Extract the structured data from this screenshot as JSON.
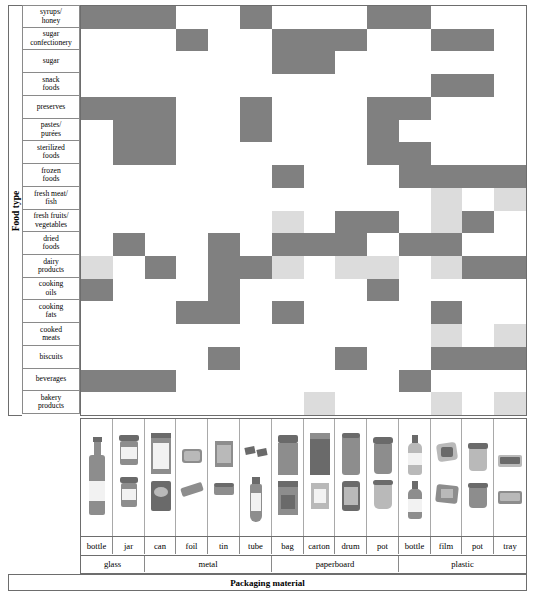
{
  "axis": {
    "y_title": "Food type",
    "x_title": "Packaging material"
  },
  "colors": {
    "filled": "#808080",
    "partial": "#dcdcdc",
    "empty": "#ffffff",
    "grid_border": "#6d6d6d"
  },
  "legend": {
    "filled_meaning": "suitable",
    "partial_meaning": "limited / conditional"
  },
  "rows": [
    {
      "label": "syrups/\nhoney",
      "line1": "syrups/",
      "line2": "honey"
    },
    {
      "label": "sugar\nconfectionery",
      "line1": "sugar",
      "line2": "confectionery"
    },
    {
      "label": "sugar",
      "line1": "sugar",
      "line2": ""
    },
    {
      "label": "snack\nfoods",
      "line1": "snack",
      "line2": "foods"
    },
    {
      "label": "preserves",
      "line1": "preserves",
      "line2": ""
    },
    {
      "label": "pastes/\npurées",
      "line1": "pastes/",
      "line2": "purées"
    },
    {
      "label": "sterilized\nfoods",
      "line1": "sterilized",
      "line2": "foods"
    },
    {
      "label": "frozen\nfoods",
      "line1": "frozen",
      "line2": "foods"
    },
    {
      "label": "fresh meat/\nfish",
      "line1": "fresh meat/",
      "line2": "fish"
    },
    {
      "label": "fresh fruits/\nvegetables",
      "line1": "fresh fruits/",
      "line2": "vegetables"
    },
    {
      "label": "dried\nfoods",
      "line1": "dried",
      "line2": "foods"
    },
    {
      "label": "dairy\nproducts",
      "line1": "dairy",
      "line2": "products"
    },
    {
      "label": "cooking\noils",
      "line1": "cooking",
      "line2": "oils"
    },
    {
      "label": "cooking\nfats",
      "line1": "cooking",
      "line2": "fats"
    },
    {
      "label": "cooked\nmeats",
      "line1": "cooked",
      "line2": "meats"
    },
    {
      "label": "biscuits",
      "line1": "biscuits",
      "line2": ""
    },
    {
      "label": "beverages",
      "line1": "beverages",
      "line2": ""
    },
    {
      "label": "bakery\nproducts",
      "line1": "bakery",
      "line2": "products"
    }
  ],
  "columns": [
    {
      "item": "bottle",
      "material": "glass"
    },
    {
      "item": "jar",
      "material": "glass"
    },
    {
      "item": "can",
      "material": "metal"
    },
    {
      "item": "foil",
      "material": "metal"
    },
    {
      "item": "tin",
      "material": "metal"
    },
    {
      "item": "tube",
      "material": "metal"
    },
    {
      "item": "bag",
      "material": "paperboard"
    },
    {
      "item": "carton",
      "material": "paperboard"
    },
    {
      "item": "drum",
      "material": "paperboard"
    },
    {
      "item": "pot",
      "material": "paperboard"
    },
    {
      "item": "bottle",
      "material": "plastic"
    },
    {
      "item": "film",
      "material": "plastic"
    },
    {
      "item": "pot",
      "material": "plastic"
    },
    {
      "item": "tray",
      "material": "plastic"
    }
  ],
  "material_groups": [
    {
      "name": "glass",
      "span": 2
    },
    {
      "name": "metal",
      "span": 4
    },
    {
      "name": "paperboard",
      "span": 4
    },
    {
      "name": "plastic",
      "span": 4
    }
  ],
  "chart_data": {
    "type": "heatmap",
    "xlabel": "Packaging material",
    "ylabel": "Food type",
    "legend": {
      "2": "filled (dark grey)",
      "1": "partial (light grey)",
      "0": "empty (white)"
    },
    "categories_x": [
      "glass bottle",
      "glass jar",
      "metal can",
      "metal foil",
      "metal tin",
      "metal tube",
      "paperboard bag",
      "paperboard carton",
      "paperboard drum",
      "paperboard pot",
      "plastic bottle",
      "plastic film",
      "plastic pot",
      "plastic tray"
    ],
    "categories_y": [
      "syrups/honey",
      "sugar confectionery",
      "sugar",
      "snack foods",
      "preserves",
      "pastes/purées",
      "sterilized foods",
      "frozen foods",
      "fresh meat/fish",
      "fresh fruits/vegetables",
      "dried foods",
      "dairy products",
      "cooking oils",
      "cooking fats",
      "cooked meats",
      "biscuits",
      "beverages",
      "bakery products"
    ],
    "values": [
      [
        2,
        2,
        2,
        0,
        0,
        2,
        0,
        0,
        0,
        2,
        2,
        0,
        0,
        0
      ],
      [
        0,
        0,
        0,
        2,
        0,
        0,
        2,
        2,
        2,
        0,
        0,
        2,
        2,
        0
      ],
      [
        0,
        0,
        0,
        0,
        0,
        0,
        2,
        2,
        0,
        0,
        0,
        0,
        0,
        0
      ],
      [
        0,
        0,
        0,
        0,
        0,
        0,
        0,
        0,
        0,
        0,
        0,
        2,
        2,
        0
      ],
      [
        2,
        2,
        2,
        0,
        0,
        2,
        0,
        0,
        0,
        2,
        2,
        0,
        0,
        0
      ],
      [
        0,
        2,
        2,
        0,
        0,
        2,
        0,
        0,
        0,
        2,
        0,
        0,
        0,
        0
      ],
      [
        0,
        2,
        2,
        0,
        0,
        0,
        0,
        0,
        0,
        2,
        2,
        0,
        0,
        0
      ],
      [
        0,
        0,
        0,
        0,
        0,
        0,
        2,
        0,
        0,
        0,
        2,
        2,
        2,
        2
      ],
      [
        0,
        0,
        0,
        0,
        0,
        0,
        0,
        0,
        0,
        0,
        0,
        1,
        0,
        1
      ],
      [
        0,
        0,
        0,
        0,
        0,
        0,
        1,
        0,
        2,
        2,
        0,
        1,
        2,
        0
      ],
      [
        0,
        2,
        0,
        0,
        2,
        0,
        2,
        2,
        2,
        0,
        2,
        2,
        0,
        0
      ],
      [
        1,
        0,
        2,
        0,
        2,
        2,
        1,
        0,
        1,
        1,
        0,
        1,
        2,
        2
      ],
      [
        2,
        0,
        0,
        0,
        2,
        0,
        0,
        0,
        0,
        2,
        0,
        0,
        0,
        0
      ],
      [
        0,
        0,
        0,
        2,
        2,
        0,
        2,
        0,
        0,
        0,
        0,
        2,
        0,
        0
      ],
      [
        0,
        0,
        0,
        0,
        0,
        0,
        0,
        0,
        0,
        0,
        0,
        1,
        0,
        1
      ],
      [
        0,
        0,
        0,
        0,
        2,
        0,
        0,
        0,
        2,
        0,
        0,
        2,
        2,
        2
      ],
      [
        2,
        2,
        2,
        0,
        0,
        0,
        0,
        0,
        0,
        0,
        2,
        0,
        0,
        0
      ],
      [
        0,
        0,
        0,
        0,
        0,
        0,
        0,
        1,
        0,
        0,
        0,
        1,
        0,
        1
      ]
    ]
  },
  "package_images": [
    {
      "name": "glass-bottle-photo",
      "kind": "bottle"
    },
    {
      "name": "glass-jar-photo",
      "kind": "jar"
    },
    {
      "name": "metal-can-photo",
      "kind": "can"
    },
    {
      "name": "metal-foil-photo",
      "kind": "foil"
    },
    {
      "name": "metal-tin-photo",
      "kind": "tin"
    },
    {
      "name": "metal-tube-photo",
      "kind": "tube"
    },
    {
      "name": "paperboard-bag-photo",
      "kind": "bag"
    },
    {
      "name": "paperboard-carton-photo",
      "kind": "carton"
    },
    {
      "name": "paperboard-drum-photo",
      "kind": "drum"
    },
    {
      "name": "paperboard-pot-photo",
      "kind": "pot"
    },
    {
      "name": "plastic-bottle-photo",
      "kind": "pbottle"
    },
    {
      "name": "plastic-film-photo",
      "kind": "film"
    },
    {
      "name": "plastic-pot-photo",
      "kind": "ppot"
    },
    {
      "name": "plastic-tray-photo",
      "kind": "tray"
    }
  ]
}
